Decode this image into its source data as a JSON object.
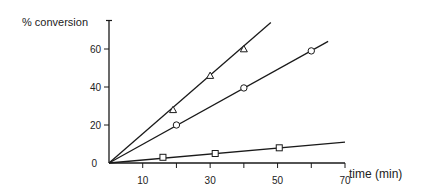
{
  "chart_data": {
    "type": "line",
    "title": "",
    "xlabel": "time (min)",
    "ylabel": "% conversion",
    "xlim": [
      0,
      70
    ],
    "ylim": [
      0,
      75
    ],
    "x_ticks": [
      10,
      20,
      30,
      40,
      50,
      60,
      70
    ],
    "x_tick_labels": [
      "10",
      "30",
      "50",
      "70"
    ],
    "y_ticks": [
      0,
      20,
      40,
      60
    ],
    "y_tick_labels": [
      "0",
      "20",
      "40",
      "60"
    ],
    "grid": false,
    "legend": null,
    "series": [
      {
        "name": "triangle",
        "marker": "triangle",
        "points": [
          [
            19,
            28
          ],
          [
            30,
            46
          ],
          [
            40,
            60
          ]
        ],
        "line_end": [
          48,
          74
        ]
      },
      {
        "name": "circle",
        "marker": "circle",
        "points": [
          [
            20,
            20
          ],
          [
            40,
            39.5
          ],
          [
            60,
            59
          ]
        ],
        "line_end": [
          65,
          64
        ]
      },
      {
        "name": "square",
        "marker": "square",
        "points": [
          [
            16,
            3
          ],
          [
            31.5,
            5
          ],
          [
            50.5,
            8
          ]
        ],
        "line_end": [
          70,
          11
        ]
      }
    ]
  }
}
